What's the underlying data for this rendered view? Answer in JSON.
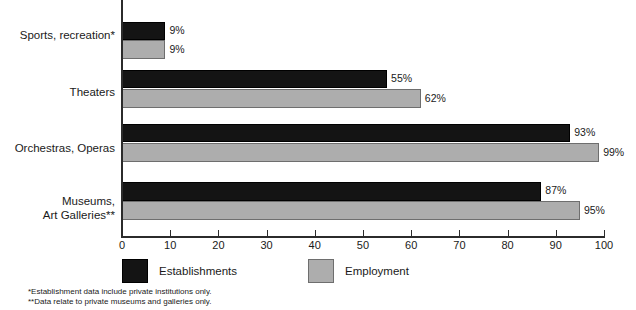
{
  "chart_data": {
    "type": "bar",
    "orientation": "horizontal",
    "title": "",
    "xlabel": "",
    "ylabel": "",
    "xlim": [
      0,
      100
    ],
    "xticks": [
      0,
      10,
      20,
      30,
      40,
      50,
      60,
      70,
      80,
      90,
      100
    ],
    "xtick_labels": [
      "0",
      "10",
      "20",
      "30",
      "40",
      "50",
      "60",
      "70",
      "80",
      "90",
      "100"
    ],
    "grid": false,
    "legend_position": "bottom-left",
    "categories": [
      "Sports, recreation*",
      "Theaters",
      "Orchestras, Operas",
      "Museums,\nArt Galleries**"
    ],
    "series": [
      {
        "name": "Establishments",
        "color": "#141414",
        "values": [
          9,
          55,
          93,
          87
        ],
        "labels": [
          "9%",
          "55%",
          "93%",
          "87%"
        ]
      },
      {
        "name": "Employment",
        "color": "#adadad",
        "values": [
          9,
          62,
          99,
          95
        ],
        "labels": [
          "9%",
          "62%",
          "99%",
          "95%"
        ]
      }
    ]
  },
  "legend": {
    "items": [
      {
        "label": "Establishments",
        "swatch": "dark"
      },
      {
        "label": "Employment",
        "swatch": "light"
      }
    ]
  },
  "footnotes": [
    "*Establishment data include private institutions only.",
    "**Data relate to private museums and galleries only."
  ]
}
